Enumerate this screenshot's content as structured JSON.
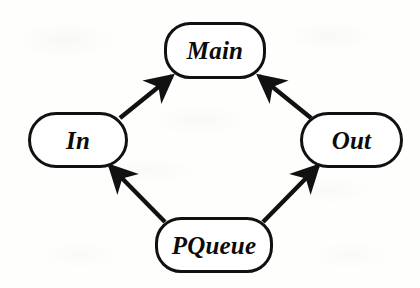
{
  "diagram": {
    "type": "directed-graph",
    "background_color": "#fefefd",
    "stroke_color": "#111111",
    "text_color": "#0b0b0b",
    "nodes": [
      {
        "id": "main",
        "label": "Main",
        "shape": "rounded-rectangle",
        "x": 164,
        "y": 22,
        "width": 102,
        "height": 57,
        "radius": 26,
        "font_size": 25
      },
      {
        "id": "in",
        "label": "In",
        "shape": "pill",
        "x": 28,
        "y": 112,
        "width": 100,
        "height": 56,
        "radius": 28,
        "font_size": 25
      },
      {
        "id": "out",
        "label": "Out",
        "shape": "pill",
        "x": 300,
        "y": 112,
        "width": 103,
        "height": 56,
        "radius": 28,
        "font_size": 25
      },
      {
        "id": "pqueue",
        "label": "PQueue",
        "shape": "rounded-rectangle",
        "x": 155,
        "y": 217,
        "width": 118,
        "height": 56,
        "radius": 26,
        "font_size": 25
      }
    ],
    "edges": [
      {
        "id": "in-to-main",
        "from": "In",
        "to": "Main",
        "arrowhead": "filled-barbed",
        "direction": "up-right",
        "x1": 120,
        "y1": 118,
        "x2": 172,
        "y2": 76
      },
      {
        "id": "out-to-main",
        "from": "Out",
        "to": "Main",
        "arrowhead": "filled-barbed",
        "direction": "up-left",
        "x1": 311,
        "y1": 118,
        "x2": 259,
        "y2": 76
      },
      {
        "id": "pqueue-to-in",
        "from": "PQueue",
        "to": "In",
        "arrowhead": "filled-barbed",
        "direction": "up-left",
        "x1": 165,
        "y1": 222,
        "x2": 110,
        "y2": 166
      },
      {
        "id": "pqueue-to-out",
        "from": "PQueue",
        "to": "Out",
        "arrowhead": "filled-barbed",
        "direction": "up-right",
        "x1": 263,
        "y1": 222,
        "x2": 318,
        "y2": 166
      }
    ]
  }
}
